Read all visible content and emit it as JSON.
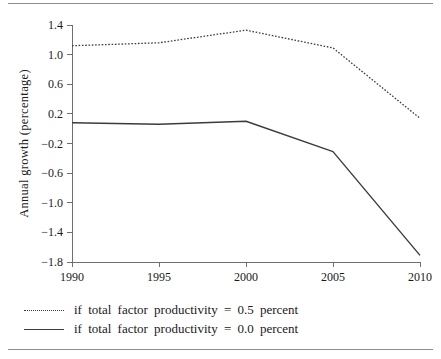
{
  "chart_data": {
    "type": "line",
    "title": "",
    "subtitle": "",
    "xlabel": "",
    "ylabel": "Annual growth (percentage)",
    "x": [
      1990,
      1995,
      2000,
      2005,
      2010
    ],
    "xtick_labels": [
      "1990",
      "1995",
      "2000",
      "2005",
      "2010"
    ],
    "xlim": [
      1990,
      2010
    ],
    "ylim": [
      -1.8,
      1.4
    ],
    "ytick_values": [
      1.4,
      1.0,
      0.6,
      0.2,
      -0.2,
      -0.6,
      -1.0,
      -1.4,
      -1.8
    ],
    "ytick_labels": [
      "1.4",
      "1.0",
      "0.6",
      "0.2",
      "−0.2",
      "−0.6",
      "−1.0",
      "−1.4",
      "−1.8"
    ],
    "grid": false,
    "legend_position": "below-left",
    "series": [
      {
        "name": "if total factor productivity = 0.5 percent",
        "style": "dotted",
        "color": "#3c3c3c",
        "values": [
          1.12,
          1.16,
          1.33,
          1.09,
          0.14
        ]
      },
      {
        "name": "if total factor productivity = 0.0 percent",
        "style": "solid",
        "color": "#3c3c3c",
        "values": [
          0.08,
          0.06,
          0.1,
          -0.31,
          -1.71
        ]
      }
    ]
  },
  "legend": {
    "entries": [
      {
        "label": "if  total  factor  productivity  =  0.5  percent",
        "style": "dotted"
      },
      {
        "label": "if  total  factor  productivity  =  0.0  percent",
        "style": "solid"
      }
    ]
  }
}
